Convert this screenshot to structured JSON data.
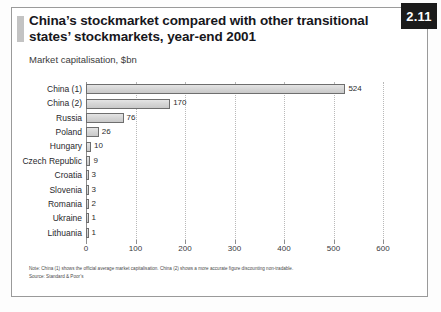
{
  "figure": {
    "number": "2.11",
    "title": "China’s stockmarket compared with other transitional states’ stockmarkets, year-end 2001",
    "subtitle": "Market capitalisation, $bn",
    "note": "Note: China (1) shows the official average market capitalisation. China (2) shows a more accurate figure discounting non-tradable.",
    "source": "Source: Standard & Poor’s"
  },
  "colors": {
    "bar_fill": "#d4d4d4",
    "bar_border": "#6e6e6e",
    "badge_bg": "#1b1b1b",
    "badge_text": "#ffffff",
    "grid": "#b9b9b9",
    "axis": "#8f8f8f",
    "frame": "#9a9a9a",
    "accent": "#c3c3c3"
  },
  "chart_data": {
    "type": "bar",
    "orientation": "horizontal",
    "title": "China’s stockmarket compared with other transitional states’ stockmarkets, year-end 2001",
    "subtitle": "Market capitalisation, $bn",
    "xlabel": "",
    "ylabel": "",
    "categories": [
      "China (1)",
      "China (2)",
      "Russia",
      "Poland",
      "Hungary",
      "Czech Republic",
      "Croatia",
      "Slovenia",
      "Romania",
      "Ukraine",
      "Lithuania"
    ],
    "values": [
      524,
      170,
      76,
      26,
      10,
      9,
      3,
      3,
      2,
      1,
      1
    ],
    "value_labels": [
      "524",
      "170",
      "76",
      "26",
      "10",
      "9",
      "3",
      "3",
      "2",
      "1",
      "1"
    ],
    "xlim": [
      0,
      600
    ],
    "xticks": [
      0,
      100,
      200,
      300,
      400,
      500,
      600
    ],
    "xtick_labels": [
      "0",
      "100",
      "200",
      "300",
      "400",
      "500",
      "600"
    ],
    "grid": "vertical-dotted",
    "legend": "none"
  }
}
